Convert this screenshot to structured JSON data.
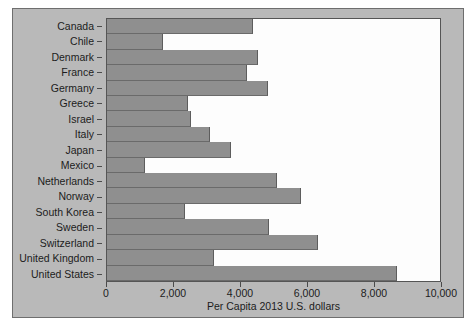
{
  "chart_data": {
    "type": "bar",
    "orientation": "horizontal",
    "title": "",
    "xlabel": "Per Capita 2013 U.S. dollars",
    "ylabel": "",
    "xlim": [
      0,
      10000
    ],
    "xticks": [
      "0",
      "2,000",
      "4,000",
      "6,000",
      "8,000",
      "10,000"
    ],
    "xtick_values": [
      0,
      2000,
      4000,
      6000,
      8000,
      10000
    ],
    "grid": false,
    "legend": "none",
    "bar_color": "#8f8f8f",
    "plot_background": "#fdfdfd",
    "figure_background": "#b9b9b9",
    "categories": [
      "Canada",
      "Chile",
      "Denmark",
      "France",
      "Germany",
      "Greece",
      "Israel",
      "Italy",
      "Japan",
      "Mexico",
      "Netherlands",
      "Norway",
      "South Korea",
      "Sweden",
      "Switzerland",
      "United Kingdom",
      "United States"
    ],
    "values": [
      4390,
      1670,
      4540,
      4210,
      4840,
      2420,
      2510,
      3080,
      3730,
      1130,
      5100,
      5820,
      2330,
      4870,
      6330,
      3220,
      8700
    ],
    "series": [
      {
        "name": "Per Capita 2013 U.S. dollars",
        "values": [
          4390,
          1670,
          4540,
          4210,
          4840,
          2420,
          2510,
          3080,
          3730,
          1130,
          5100,
          5820,
          2330,
          4870,
          6330,
          3220,
          8700
        ]
      }
    ]
  }
}
